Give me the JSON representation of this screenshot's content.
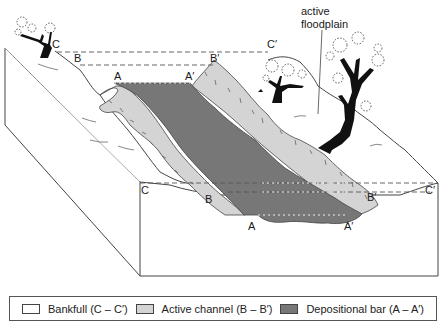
{
  "figure": {
    "annotation": {
      "line1": "active",
      "line2": "floodplain"
    },
    "labels": {
      "top_C": "C",
      "top_C_prime": "C′",
      "top_B": "B",
      "top_B_prime": "B′",
      "top_A": "A",
      "top_A_prime": "A′",
      "front_C": "C",
      "front_C_prime": "C′",
      "front_B": "B",
      "front_B_prime": "B′",
      "front_A": "A",
      "front_A_prime": "A′"
    }
  },
  "legend": {
    "items": [
      {
        "label": "Bankfull (C – C′)",
        "color": "#ffffff"
      },
      {
        "label": "Active channel (B – B′)",
        "color": "#d4d4d4"
      },
      {
        "label": "Depositional bar (A – A′)",
        "color": "#777777"
      }
    ]
  },
  "colors": {
    "bankfull": "#ffffff",
    "active_channel": "#d4d4d4",
    "depositional_bar": "#777777",
    "outline": "#333333",
    "tree": "#111111"
  }
}
